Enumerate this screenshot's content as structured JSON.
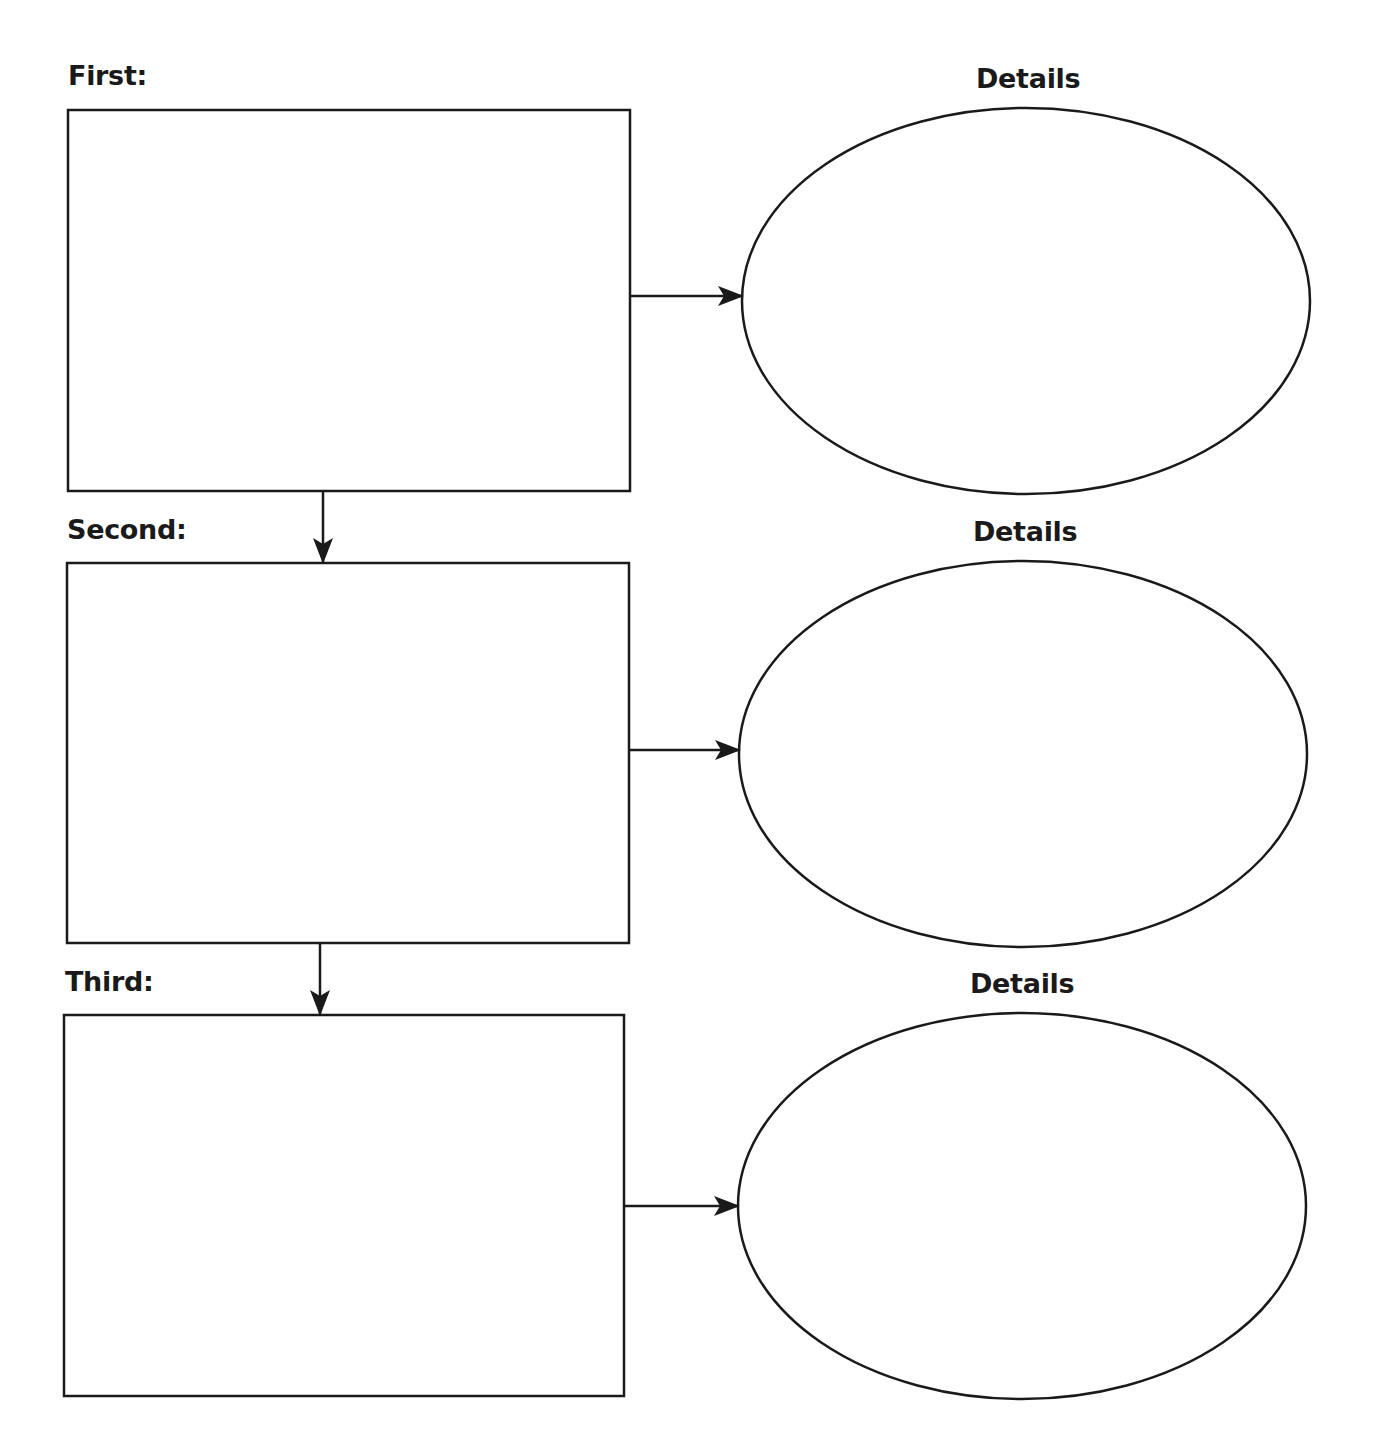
{
  "organizer": {
    "type": "sequence-chart",
    "steps": [
      {
        "label": "First:",
        "details_label": "Details"
      },
      {
        "label": "Second:",
        "details_label": "Details"
      },
      {
        "label": "Third:",
        "details_label": "Details"
      }
    ]
  },
  "colors": {
    "stroke": "#1a1a1a",
    "background": "#ffffff"
  }
}
